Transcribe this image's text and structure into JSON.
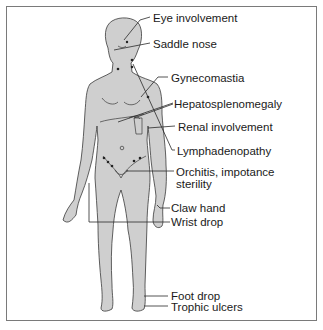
{
  "diagram": {
    "type": "anatomical-callout",
    "colors": {
      "body_fill": "#cfcfcf",
      "outline": "#3a3a3a",
      "leader": "#2a2a2a",
      "frame": "#7a7a7a"
    },
    "labels": [
      {
        "id": "eye",
        "text": "Eye involvement"
      },
      {
        "id": "nose",
        "text": "Saddle nose"
      },
      {
        "id": "gyneco",
        "text": "Gynecomastia"
      },
      {
        "id": "hepato",
        "text": "Hepatosplenomegaly"
      },
      {
        "id": "renal",
        "text": "Renal involvement"
      },
      {
        "id": "lymph",
        "text": "Lymphadenopathy"
      },
      {
        "id": "orchitis1",
        "text": "Orchitis, impotance"
      },
      {
        "id": "orchitis2",
        "text": "sterility"
      },
      {
        "id": "claw",
        "text": "Claw hand"
      },
      {
        "id": "wrist",
        "text": "Wrist drop"
      },
      {
        "id": "foot",
        "text": "Foot drop"
      },
      {
        "id": "trophic",
        "text": "Trophic ulcers"
      }
    ]
  }
}
